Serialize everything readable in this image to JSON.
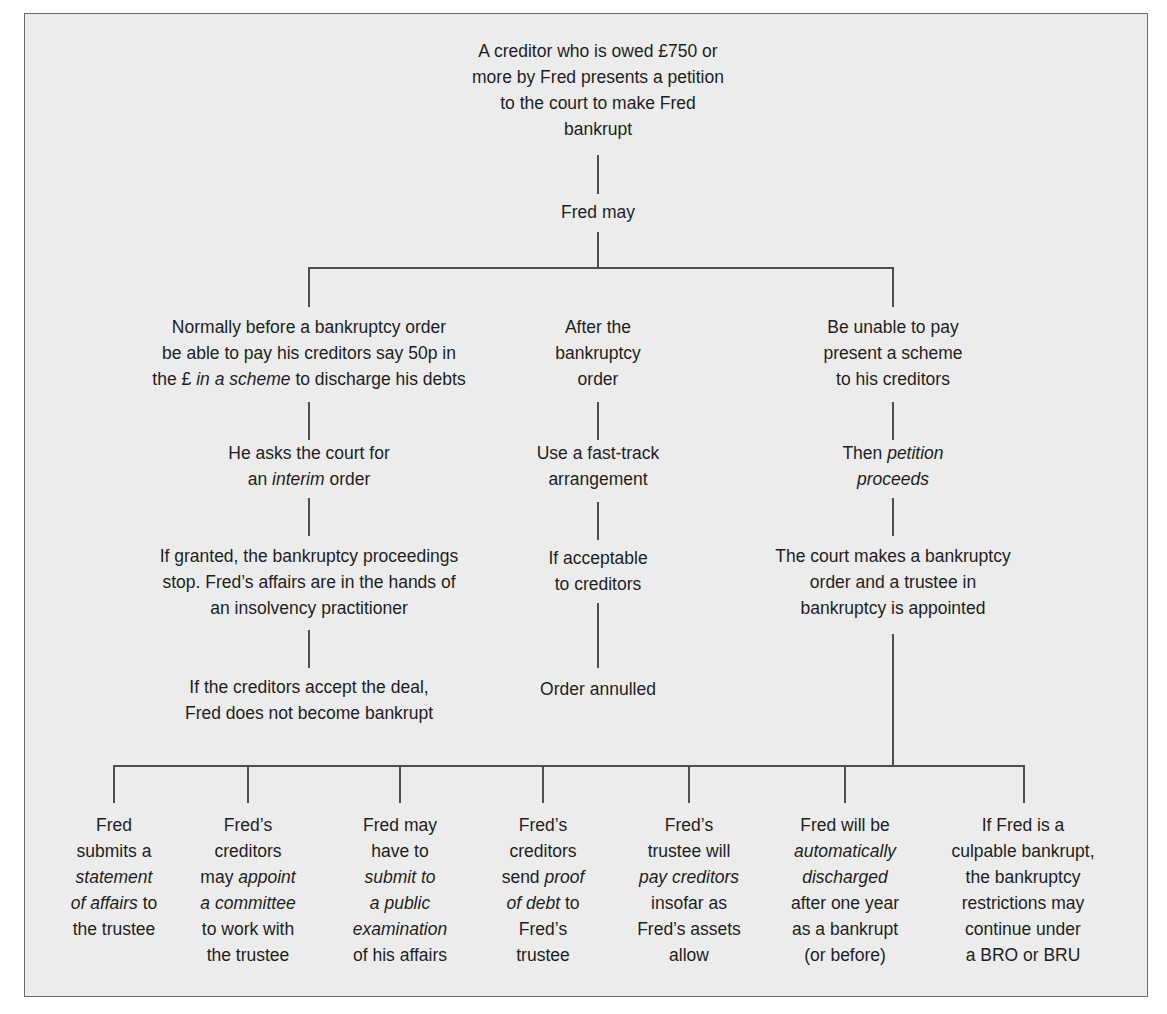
{
  "diagram": {
    "root": {
      "lines": [
        "A creditor who is owed £750 or",
        "more by Fred presents a petition",
        "to the court to make Fred",
        "bankrupt"
      ]
    },
    "fred_may": "Fred may",
    "branches": {
      "left": {
        "option": [
          "Normally before a bankruptcy order",
          "be able to pay his creditors say 50p in",
          {
            "pre": "the £ ",
            "em": "in a scheme",
            "post": " to discharge his debts"
          }
        ],
        "step1": [
          "He asks the court for",
          {
            "pre": "an ",
            "em": "interim",
            "post": " order"
          }
        ],
        "step2": [
          "If granted, the bankruptcy proceedings",
          "stop. Fred’s affairs are in the hands of",
          "an insolvency practitioner"
        ],
        "step3": [
          "If the creditors accept the deal,",
          "Fred does not become bankrupt"
        ]
      },
      "middle": {
        "option": [
          "After the",
          "bankruptcy",
          "order"
        ],
        "step1": [
          "Use a fast-track",
          "arrangement"
        ],
        "step2": [
          "If acceptable",
          "to creditors"
        ],
        "step3": [
          "Order annulled"
        ]
      },
      "right": {
        "option": [
          "Be unable to pay",
          "present a scheme",
          "to his creditors"
        ],
        "step1": [
          {
            "pre": "Then ",
            "em": "petition",
            "post": ""
          },
          {
            "pre": "",
            "em": "proceeds",
            "post": ""
          }
        ],
        "step2": [
          "The court makes a bankruptcy",
          "order and a trustee in",
          "bankruptcy is appointed"
        ]
      }
    },
    "consequences": [
      {
        "lines": [
          "Fred",
          "submits a",
          {
            "pre": "",
            "em": "statement",
            "post": ""
          },
          {
            "pre": "",
            "em": "of affairs",
            "post": " to"
          },
          "the trustee"
        ]
      },
      {
        "lines": [
          "Fred’s",
          "creditors",
          {
            "pre": "may ",
            "em": "appoint",
            "post": ""
          },
          {
            "pre": "",
            "em": "a committee",
            "post": ""
          },
          "to work with",
          "the trustee"
        ]
      },
      {
        "lines": [
          "Fred may",
          "have to",
          {
            "pre": "",
            "em": "submit to",
            "post": ""
          },
          {
            "pre": "",
            "em": "a public",
            "post": ""
          },
          {
            "pre": "",
            "em": "examination",
            "post": ""
          },
          "of his affairs"
        ]
      },
      {
        "lines": [
          "Fred’s",
          "creditors",
          {
            "pre": "send ",
            "em": "proof",
            "post": ""
          },
          {
            "pre": "",
            "em": "of debt",
            "post": " to"
          },
          "Fred’s",
          "trustee"
        ]
      },
      {
        "lines": [
          "Fred’s",
          "trustee will",
          {
            "pre": "",
            "em": "pay creditors",
            "post": ""
          },
          "insofar as",
          "Fred’s assets",
          "allow"
        ]
      },
      {
        "lines": [
          "Fred will be",
          {
            "pre": "",
            "em": "automatically",
            "post": ""
          },
          {
            "pre": "",
            "em": "discharged",
            "post": ""
          },
          "after one year",
          "as a bankrupt",
          "(or before)"
        ]
      },
      {
        "lines": [
          "If Fred is a",
          "culpable bankrupt,",
          "the bankruptcy",
          "restrictions may",
          "continue under",
          "a BRO or BRU"
        ]
      }
    ],
    "colors": {
      "background": "#ececec",
      "line": "#4e4e4e",
      "text": "#1e1e1e",
      "border": "#6a6a6a"
    }
  }
}
